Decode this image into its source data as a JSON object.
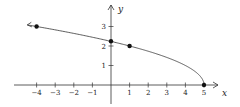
{
  "chart_data": {
    "type": "line",
    "title": "",
    "xlabel": "x",
    "ylabel": "y",
    "function": "y = sqrt(5 - x)",
    "xlim": [
      -4.8,
      5.8
    ],
    "ylim": [
      -1.0,
      3.6
    ],
    "grid": false,
    "legend": null,
    "x_ticks": [
      -4,
      -3,
      -2,
      -1,
      1,
      2,
      3,
      4,
      5
    ],
    "x_tick_labels": [
      "−4",
      "−3",
      "−2",
      "−1",
      "1",
      "2",
      "3",
      "4",
      "5"
    ],
    "y_ticks": [
      1,
      2,
      3
    ],
    "y_tick_labels": [
      "1",
      "2",
      "3"
    ],
    "series": [
      {
        "name": "y = √(5 − x)",
        "x": [
          -4.5,
          -4,
          -3,
          -2,
          -1,
          0,
          1,
          2,
          3,
          4,
          4.5,
          4.8,
          5
        ],
        "values": [
          3.08,
          3.0,
          2.83,
          2.65,
          2.45,
          2.24,
          2.0,
          1.73,
          1.41,
          1.0,
          0.71,
          0.45,
          0.0
        ],
        "left_end": "arrow",
        "right_end": "closed-point"
      }
    ],
    "marked_points": [
      {
        "x": -4,
        "y": 3
      },
      {
        "x": 0,
        "y": 2.24
      },
      {
        "x": 1,
        "y": 2
      },
      {
        "x": 5,
        "y": 0
      }
    ]
  },
  "axes": {
    "x_label": "x",
    "y_label": "y"
  }
}
